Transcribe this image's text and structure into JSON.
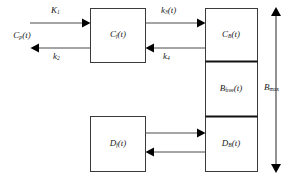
{
  "diagram": {
    "type": "compartment-block-diagram",
    "title": "",
    "boxes": [
      {
        "id": "cp",
        "label_main": "C",
        "label_sub": "p",
        "label_tail": "(t)",
        "text": "Cp(t)",
        "kind": "free-text-node"
      },
      {
        "id": "cf",
        "label_main": "C",
        "label_sub": "f",
        "label_tail": "(t)",
        "text": "Cf(t)",
        "kind": "box"
      },
      {
        "id": "cb",
        "label_main": "C",
        "label_sub": "B",
        "label_tail": "(t)",
        "text": "CB(t)",
        "kind": "box"
      },
      {
        "id": "bfree",
        "label_main": "B",
        "label_sub": "free",
        "label_tail": "(t)",
        "text": "Bfree(t)",
        "kind": "box"
      },
      {
        "id": "db",
        "label_main": "D",
        "label_sub": "B",
        "label_tail": "(t)",
        "text": "DB(t)",
        "kind": "box"
      },
      {
        "id": "df",
        "label_main": "D",
        "label_sub": "f",
        "label_tail": "(t)",
        "text": "Df(t)",
        "kind": "box"
      }
    ],
    "arrows": [
      {
        "id": "k1",
        "label_main": "K",
        "label_sub": "1",
        "label_tail": "",
        "text": "K1",
        "from": "cp",
        "to": "cf",
        "direction": "right"
      },
      {
        "id": "k2",
        "label_main": "k",
        "label_sub": "2",
        "label_tail": "",
        "text": "k2",
        "from": "cf",
        "to": "cp",
        "direction": "left"
      },
      {
        "id": "k3",
        "label_main": "k",
        "label_sub": "3",
        "label_tail": "(t)",
        "text": "k3(t)",
        "from": "cf",
        "to": "cb",
        "direction": "right"
      },
      {
        "id": "k4",
        "label_main": "k",
        "label_sub": "4",
        "label_tail": "",
        "text": "k4",
        "from": "cb",
        "to": "cf",
        "direction": "left"
      },
      {
        "id": "df-to-db",
        "label_main": "",
        "label_sub": "",
        "label_tail": "",
        "text": "",
        "from": "df",
        "to": "db",
        "direction": "right"
      },
      {
        "id": "db-to-df",
        "label_main": "",
        "label_sub": "",
        "label_tail": "",
        "text": "",
        "from": "db",
        "to": "df",
        "direction": "left"
      }
    ],
    "axis": {
      "id": "bmax",
      "label_main": "B",
      "label_sub": "max",
      "label_tail": "",
      "text": "Bmax",
      "style": "double-headed-vertical"
    },
    "colors": {
      "background": "#ffffff",
      "box_stroke": "#3a3a3a",
      "divider_stroke": "#111111",
      "line_stroke": "#4a4a4a",
      "arrow_fill": "#000000",
      "text": "#1a1a1a"
    }
  }
}
